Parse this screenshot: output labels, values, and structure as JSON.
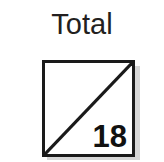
{
  "card": {
    "title": "Total",
    "score": "18",
    "box": {
      "divider": "diagonal-line-bottom-left-to-top-right"
    },
    "colors": {
      "background": "#ffffff",
      "border": "#1a1a1a",
      "title_text": "#231f20",
      "score_text": "#111111",
      "shadow": "#c9c9c9"
    }
  }
}
